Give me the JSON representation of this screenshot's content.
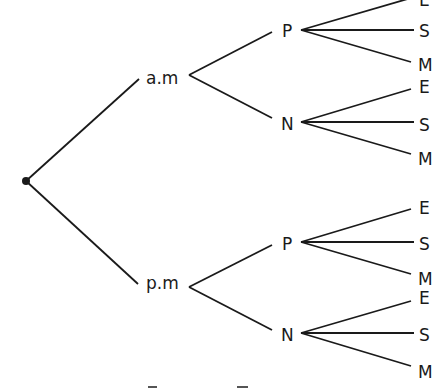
{
  "diagram": {
    "type": "tree",
    "root": {
      "label": "",
      "marker": "dot"
    },
    "level1": [
      {
        "id": "am",
        "label": "a.m"
      },
      {
        "id": "pm",
        "label": "p.m"
      }
    ],
    "level2": {
      "am": [
        {
          "id": "am_p",
          "label": "P"
        },
        {
          "id": "am_n",
          "label": "N"
        }
      ],
      "pm": [
        {
          "id": "pm_p",
          "label": "P"
        },
        {
          "id": "pm_n",
          "label": "N"
        }
      ]
    },
    "level3": {
      "am_p": [
        "E",
        "S",
        "M"
      ],
      "am_n": [
        "E",
        "S",
        "M"
      ],
      "pm_p": [
        "E",
        "S",
        "M"
      ],
      "pm_n": [
        "E",
        "S",
        "M"
      ]
    },
    "colors": {
      "line": "#1a1a1a",
      "background": "#ffffff"
    }
  },
  "labels": {
    "am": "a.m",
    "pm": "p.m",
    "am_p": "P",
    "am_n": "N",
    "pm_p": "P",
    "pm_n": "N",
    "am_p_e": "E",
    "am_p_s": "S",
    "am_p_m": "M",
    "am_n_e": "E",
    "am_n_s": "S",
    "am_n_m": "M",
    "pm_p_e": "E",
    "pm_p_s": "S",
    "pm_p_m": "M",
    "pm_n_e": "E",
    "pm_n_s": "S",
    "pm_n_m": "M"
  }
}
